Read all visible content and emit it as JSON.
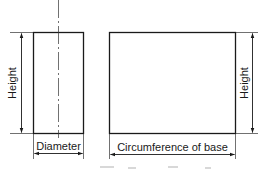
{
  "figure": {
    "left_view": {
      "shape": "cylinder side elevation",
      "height_label": "Height",
      "width_label": "Diameter"
    },
    "right_view": {
      "shape": "cylinder surface development (unrolled rectangle)",
      "height_label": "Height",
      "width_label": "Circumference of base"
    },
    "colors": {
      "line": "#1a1a1a",
      "background": "#ffffff"
    }
  }
}
